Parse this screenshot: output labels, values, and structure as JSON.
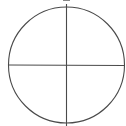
{
  "diagram": {
    "type": "circle-quadrants",
    "stroke_color": "#4a4a4a",
    "background": "#ffffff",
    "circle": {
      "cx": 66.5,
      "cy": 65,
      "r": 58
    },
    "vertical_line": {
      "x": 66.5,
      "y1": 4,
      "y2": 126
    },
    "horizontal_line": {
      "y": 65,
      "x1": 8,
      "x2": 125
    },
    "top_mark": {
      "x1": 63,
      "x2": 70,
      "y": 0.5
    }
  }
}
